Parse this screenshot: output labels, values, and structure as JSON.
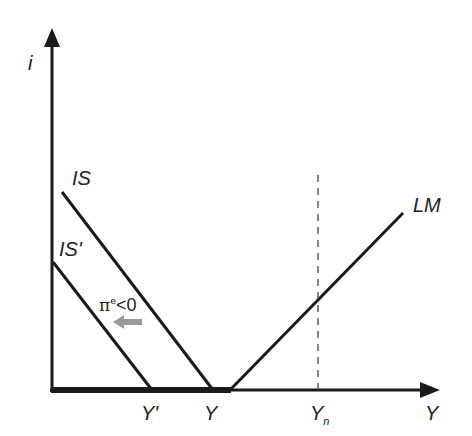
{
  "diagram": {
    "axes": {
      "y_label": "i",
      "x_label": "Y"
    },
    "curves": {
      "is": {
        "label": "IS"
      },
      "is_prime": {
        "label": "IS'"
      },
      "lm": {
        "label": "LM"
      }
    },
    "annotations": {
      "expectation": "π",
      "expectation_sup": "e",
      "expectation_rest": "<0",
      "shift_arrow": "left-arrow"
    },
    "x_ticks": {
      "y_prime": "Y'",
      "y": "Y",
      "y_n_main": "Y",
      "y_n_sub": "n"
    },
    "colors": {
      "line": "#1a1a1a",
      "arrow": "#999999",
      "dashed": "#444444"
    }
  }
}
